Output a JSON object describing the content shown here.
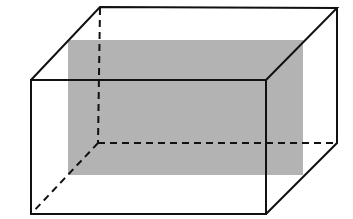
{
  "diagram": {
    "type": "rectangular-prism-with-cross-section",
    "colors": {
      "background": "#ffffff",
      "edge": "#111111",
      "cross_section_fill": "#b3b3b3"
    },
    "edge_width": 2,
    "vertices": {
      "front_top_left": [
        31,
        80
      ],
      "front_top_right": [
        266,
        80
      ],
      "front_bottom_left": [
        31,
        214
      ],
      "front_bottom_right": [
        266,
        214
      ],
      "back_top_left": [
        100,
        7
      ],
      "back_top_right": [
        337,
        8
      ],
      "back_bottom_left": [
        98,
        143
      ],
      "back_bottom_right": [
        337,
        143
      ]
    },
    "cross_section": {
      "x": 68,
      "y": 40,
      "width": 235,
      "height": 135
    }
  }
}
